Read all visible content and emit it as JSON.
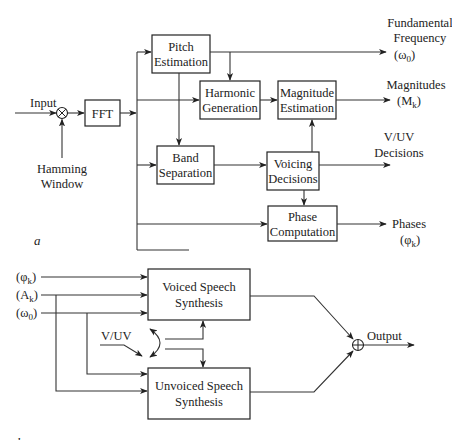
{
  "diagram_a": {
    "label": "a",
    "input_label": "Input",
    "window_label_1": "Hamming",
    "window_label_2": "Window",
    "multiply_symbol": "⊗",
    "blocks": {
      "fft": "FFT",
      "pitch": [
        "Pitch",
        "Estimation"
      ],
      "harmonic": [
        "Harmonic",
        "Generation"
      ],
      "magnitude": [
        "Magnitude",
        "Estimation"
      ],
      "band": [
        "Band",
        "Separation"
      ],
      "voicing": [
        "Voicing",
        "Decisions"
      ],
      "phase": [
        "Phase",
        "Computation"
      ]
    },
    "outputs": {
      "fundamental": [
        "Fundamental",
        "Frequency",
        "(ω",
        "0",
        ")"
      ],
      "magnitudes": [
        "Magnitudes",
        "(M",
        "k",
        ")"
      ],
      "vuv": [
        "V/UV",
        "Decisions"
      ],
      "phases": [
        "Phases",
        "(φ",
        "k",
        ")"
      ]
    }
  },
  "diagram_b": {
    "label": "b",
    "inputs": {
      "phi": [
        "(φ",
        "k",
        ")"
      ],
      "amp": [
        "(A",
        "k",
        ")"
      ],
      "omega": [
        "(ω",
        "0",
        ")"
      ]
    },
    "vuv_label": "V/UV",
    "blocks": {
      "voiced": [
        "Voiced Speech",
        "Synthesis"
      ],
      "unvoiced": [
        "Unvoiced Speech",
        "Synthesis"
      ]
    },
    "sum_symbol": "⊕",
    "output_label": "Output"
  }
}
